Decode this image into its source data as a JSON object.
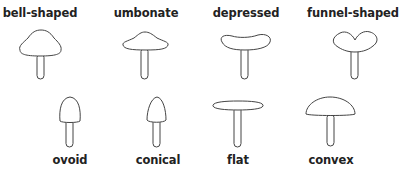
{
  "stroke_color": "#444444",
  "text_color": "#222222",
  "shapes": [
    {
      "label": "bell-shaped",
      "row": 1,
      "label_position": "above"
    },
    {
      "label": "umbonate",
      "row": 1,
      "label_position": "above"
    },
    {
      "label": "depressed",
      "row": 1,
      "label_position": "above"
    },
    {
      "label": "funnel-shaped",
      "row": 1,
      "label_position": "above"
    },
    {
      "label": "ovoid",
      "row": 2,
      "label_position": "below"
    },
    {
      "label": "conical",
      "row": 2,
      "label_position": "below"
    },
    {
      "label": "flat",
      "row": 2,
      "label_position": "below"
    },
    {
      "label": "convex",
      "row": 2,
      "label_position": "below"
    }
  ]
}
